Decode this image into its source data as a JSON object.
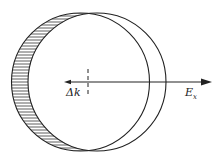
{
  "diagram": {
    "labels": {
      "shift": "Δk",
      "field": "E",
      "field_subscript": "x"
    },
    "colors": {
      "stroke": "#222222",
      "hatch": "#333333",
      "background": "#ffffff"
    },
    "geometry": {
      "shifted_circle": {
        "cx": 80.5,
        "cy": 82,
        "r": 69
      },
      "original_circle": {
        "cx": 97,
        "cy": 82,
        "r": 69
      },
      "axis_arrow": {
        "x1": 65,
        "x2": 212,
        "y": 82
      },
      "dashed_marker_x": 88
    }
  }
}
